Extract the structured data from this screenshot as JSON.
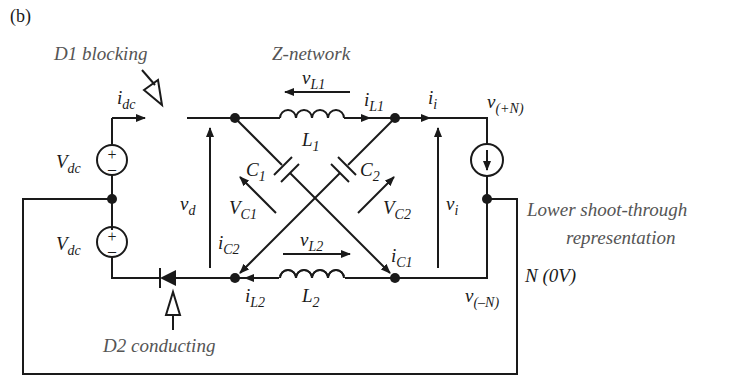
{
  "figure_label": "(b)",
  "annotations": {
    "d1": "D1 blocking",
    "d2": "D2 conducting",
    "znet": "Z-network",
    "lower_st_1": "Lower shoot-through",
    "lower_st_2": "representation"
  },
  "labels": {
    "idc_main": "i",
    "idc_sub": "dc",
    "vdc1_main": "V",
    "vdc1_sub": "dc",
    "vdc2_main": "V",
    "vdc2_sub": "dc",
    "vd_main": "v",
    "vd_sub": "d",
    "vL1_main": "v",
    "vL1_sub": "L1",
    "iL1_main": "i",
    "iL1_sub": "L1",
    "L1_main": "L",
    "L1_sub": "1",
    "C1_main": "C",
    "C1_sub": "1",
    "C2_main": "C",
    "C2_sub": "2",
    "VC1_main": "V",
    "VC1_sub": "C1",
    "VC2_main": "V",
    "VC2_sub": "C2",
    "ii_main": "i",
    "ii_sub": "i",
    "vi_main": "v",
    "vi_sub": "i",
    "vpn_main": "v",
    "vpn_sub": "(+N)",
    "vmn_main": "v",
    "vmn_sub": "(–N)",
    "iC2_main": "i",
    "iC2_sub": "C2",
    "iC1_main": "i",
    "iC1_sub": "C1",
    "vL2_main": "v",
    "vL2_sub": "L2",
    "iL2_main": "i",
    "iL2_sub": "L2",
    "L2_main": "L",
    "L2_sub": "2",
    "N_label": "N (0V)",
    "plus": "+",
    "minus": "–"
  }
}
